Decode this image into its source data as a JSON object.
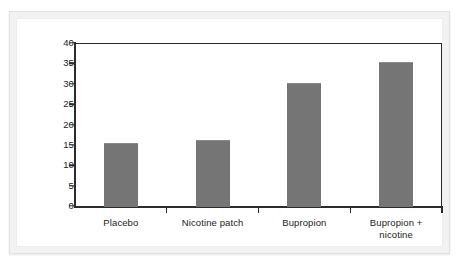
{
  "chart_data": {
    "type": "bar",
    "title": "",
    "subtitle": "",
    "xlabel": "",
    "ylabel": "",
    "categories": [
      "Placebo",
      "Nicotine patch",
      "Bupropion",
      "Bupropion +\nnicotine"
    ],
    "values": [
      15.4,
      16.2,
      30.3,
      35.3
    ],
    "series": [
      {
        "name": "Abstinence rate",
        "values": [
          15.4,
          16.2,
          30.3,
          35.3
        ]
      }
    ],
    "ylim": [
      0,
      40
    ],
    "yticks": [
      0,
      5,
      10,
      15,
      20,
      25,
      30,
      35,
      40
    ],
    "ytick_labels": [
      "0",
      "5",
      "10",
      "15",
      "20",
      "25",
      "30",
      "35",
      "40"
    ],
    "grid": false,
    "legend": null,
    "legend_position": "none",
    "bar_color": "#757575",
    "axis_color": "#2b2b2b",
    "plot_background": "#ffffff",
    "frame_background": "#f2f2f2"
  }
}
